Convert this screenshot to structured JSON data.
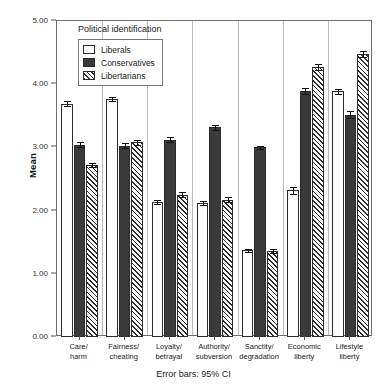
{
  "chart_data": {
    "type": "bar",
    "title": "",
    "xlabel": "",
    "ylabel": "Mean",
    "ylim": [
      0.0,
      5.0
    ],
    "ytick_labels": [
      "0.00",
      "1.00",
      "2.00",
      "3.00",
      "4.00",
      "5.00"
    ],
    "ytick_values": [
      0,
      1,
      2,
      3,
      4,
      5
    ],
    "grid": false,
    "legend_position": "upper-left-inside",
    "legend_title": "Political identification",
    "categories": [
      "Care/ harm",
      "Fairness/ cheating",
      "Loyalty/ betrayal",
      "Authority/ subversion",
      "Sanctity/ degradation",
      "Economic liberty",
      "Lifestyle liberty"
    ],
    "category_lines": [
      [
        "Care/",
        "harm"
      ],
      [
        "Fairness/",
        "cheating"
      ],
      [
        "Loyalty/",
        "betrayal"
      ],
      [
        "Authority/",
        "subversion"
      ],
      [
        "Sanctity/",
        "degradation"
      ],
      [
        "Economic",
        "liberty"
      ],
      [
        "Lifestyle",
        "liberty"
      ]
    ],
    "series": [
      {
        "name": "Liberals",
        "fill": "white",
        "values": [
          3.69,
          3.76,
          2.14,
          2.12,
          1.37,
          2.32,
          3.89
        ],
        "ci_low": [
          3.65,
          3.73,
          2.11,
          2.09,
          1.35,
          2.27,
          3.85
        ],
        "ci_high": [
          3.73,
          3.79,
          2.17,
          2.15,
          1.4,
          2.37,
          3.93
        ]
      },
      {
        "name": "Conservatives",
        "fill": "solid-dark",
        "values": [
          3.04,
          3.03,
          3.12,
          3.32,
          3.0,
          3.89,
          3.52
        ],
        "ci_low": [
          3.0,
          2.99,
          3.08,
          3.28,
          2.97,
          3.84,
          3.46
        ],
        "ci_high": [
          3.08,
          3.07,
          3.16,
          3.36,
          3.03,
          3.94,
          3.58
        ]
      },
      {
        "name": "Libertarians",
        "fill": "hatched",
        "values": [
          2.72,
          3.08,
          2.25,
          2.17,
          1.36,
          4.27,
          4.48
        ],
        "ci_low": [
          2.69,
          3.04,
          2.21,
          2.13,
          1.33,
          4.22,
          4.43
        ],
        "ci_high": [
          2.75,
          3.12,
          2.29,
          2.21,
          1.39,
          4.32,
          4.53
        ]
      }
    ],
    "annotations": [
      "Error bars: 95% CI"
    ],
    "footnote": "Error bars: 95% CI"
  },
  "colors": {
    "liberals": "#ffffff",
    "conservatives": "#3a3a3a",
    "libertarians_hatch": "#2f2f2f",
    "axis": "#6e6e6e",
    "text": "#1a1a1a"
  }
}
